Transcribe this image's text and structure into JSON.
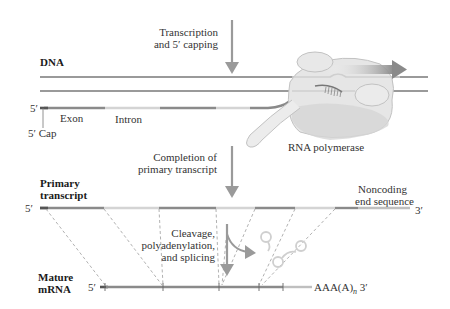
{
  "labels": {
    "step1_line1": "Transcription",
    "step1_line2": "and 5′ capping",
    "dna": "DNA",
    "five_prime": "5′",
    "exon": "Exon",
    "intron": "Intron",
    "five_cap": "5′ Cap",
    "rna_polymerase": "RNA polymerase",
    "step2_line1": "Completion of",
    "step2_line2": "primary transcript",
    "primary_line1": "Primary",
    "primary_line2": "transcript",
    "noncoding_line1": "Noncoding",
    "noncoding_line2": "end sequence",
    "three_prime": "3′",
    "step3_line1": "Cleavage,",
    "step3_line2": "polyadenylation,",
    "step3_line3": "and splicing",
    "mature_line1": "Mature",
    "mature_line2": "mRNA",
    "polya_tail": "AAA(A)",
    "polya_sub": "n",
    "polya_3": " 3′"
  },
  "colors": {
    "exon": "#8a8a8a",
    "intron": "#d4d4d4",
    "cap": "#555555",
    "dna": "#9a9a9a",
    "arrow": "#9a9a9a",
    "polymerase": "#e4e4e4",
    "polymerase_edge": "#c0c0c0",
    "dashed": "#a8a8a8",
    "lariat": "#cfcfcf"
  }
}
